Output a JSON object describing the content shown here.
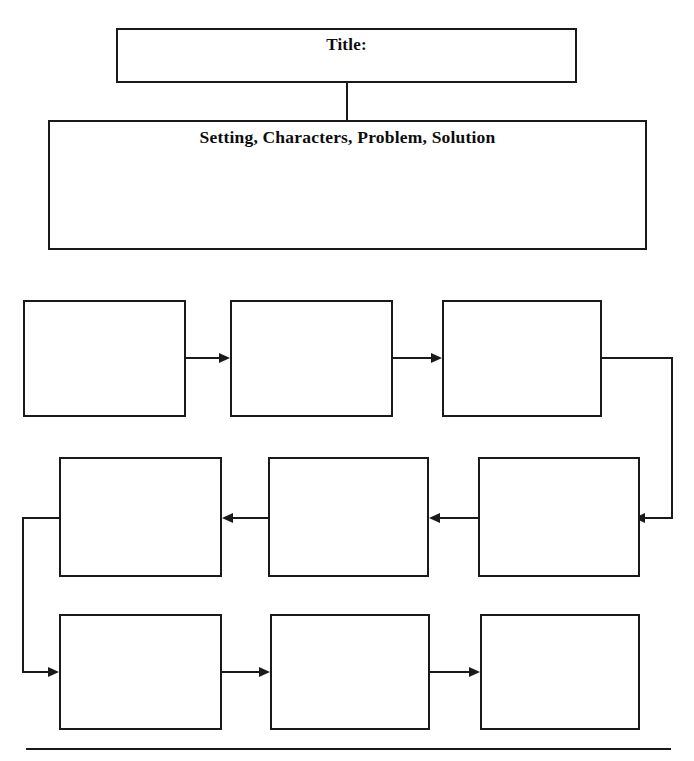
{
  "worksheet": {
    "name": "story-map-graphic-organizer",
    "width": 694,
    "height": 761,
    "background_color": "#ffffff",
    "ink_color": "#1a1a1a"
  },
  "title_box": {
    "label": "Title:",
    "value": ""
  },
  "elements_box": {
    "label": "Setting, Characters, Problem, Solution",
    "value": ""
  },
  "sequence": {
    "flow_description": "serpentine",
    "rows": [
      {
        "direction": "left-to-right",
        "cells": [
          {
            "index": 1,
            "value": ""
          },
          {
            "index": 2,
            "value": ""
          },
          {
            "index": 3,
            "value": ""
          }
        ]
      },
      {
        "direction": "right-to-left",
        "cells": [
          {
            "index": 4,
            "value": ""
          },
          {
            "index": 5,
            "value": ""
          },
          {
            "index": 6,
            "value": ""
          }
        ]
      },
      {
        "direction": "left-to-right",
        "cells": [
          {
            "index": 7,
            "value": ""
          },
          {
            "index": 8,
            "value": ""
          },
          {
            "index": 9,
            "value": ""
          }
        ]
      }
    ]
  },
  "connectors": {
    "row1_to_row2_wrap": "right-down-left",
    "row2_to_row3_wrap": "left-down-right"
  },
  "footer": {
    "rule": ""
  }
}
